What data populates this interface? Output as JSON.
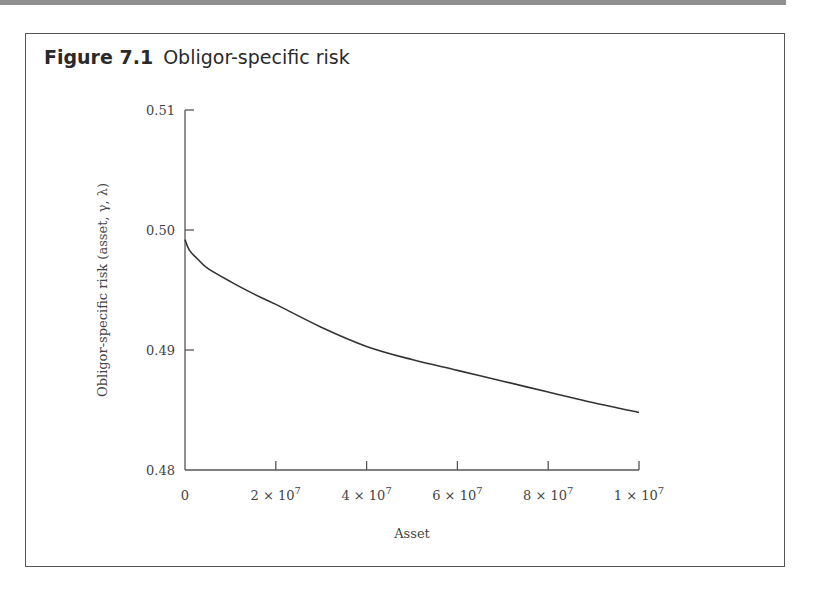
{
  "figure": {
    "number": "Figure 7.1",
    "title": "Obligor-specific risk"
  },
  "colors": {
    "line": "#333333",
    "axis": "#555555",
    "band": "#8f8f8f"
  },
  "chart_data": {
    "type": "line",
    "title": "Obligor-specific risk",
    "xlabel": "Asset",
    "ylabel": "Obligor-specific risk (asset, γ, λ)",
    "xlim": [
      0,
      100000000
    ],
    "ylim": [
      0.48,
      0.51
    ],
    "x_ticks": [
      0,
      20000000,
      40000000,
      60000000,
      80000000,
      100000000
    ],
    "x_tick_labels": [
      "0",
      "2 × 10⁷",
      "4 × 10⁷",
      "6 × 10⁷",
      "8 × 10⁷",
      "1 × 10⁷"
    ],
    "y_ticks": [
      0.48,
      0.49,
      0.5,
      0.51
    ],
    "y_tick_labels": [
      "0.48",
      "0.49",
      "0.50",
      "0.51"
    ],
    "grid": false,
    "legend": null,
    "series": [
      {
        "name": "Obligor-specific risk",
        "x": [
          0,
          1000000,
          3000000,
          5000000,
          10000000,
          15000000,
          20000000,
          30000000,
          40000000,
          50000000,
          60000000,
          70000000,
          80000000,
          90000000,
          100000000
        ],
        "values": [
          0.4992,
          0.4983,
          0.4975,
          0.4968,
          0.4957,
          0.4947,
          0.4938,
          0.4919,
          0.4903,
          0.4892,
          0.4883,
          0.4874,
          0.4865,
          0.4856,
          0.4848
        ]
      }
    ]
  }
}
